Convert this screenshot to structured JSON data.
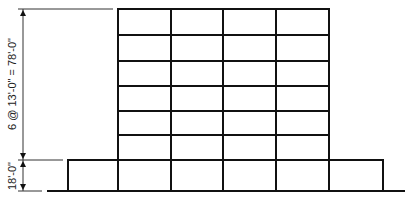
{
  "diagram": {
    "type": "building-elevation",
    "stroke_color": "#111111",
    "dim_color": "#333333",
    "dimensions": {
      "typical_floors": "6 @ 13'-0\" = 78'-0\"",
      "podium": "18'-0\""
    },
    "tower": {
      "columns_x": [
        118,
        171,
        223,
        276,
        329
      ],
      "floors_y": [
        9,
        35,
        61,
        86,
        111,
        135,
        160
      ],
      "bays": 4,
      "stories": 6
    },
    "podium": {
      "left": 68,
      "right": 383,
      "top": 160,
      "bottom": 191
    },
    "ground": {
      "y": 191,
      "x1": 47,
      "x2": 405
    }
  }
}
